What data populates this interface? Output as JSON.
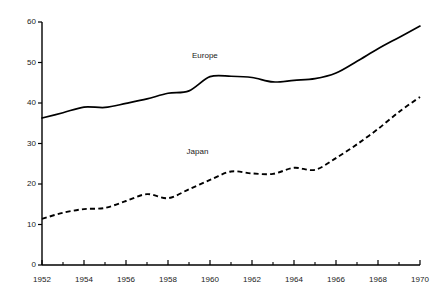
{
  "chart_data": {
    "type": "line",
    "title": "",
    "subtitle": "",
    "xlabel": "",
    "ylabel": "",
    "xlim": [
      1952,
      1970
    ],
    "ylim": [
      0,
      60
    ],
    "grid": false,
    "legend_position": "inline-annotation",
    "x": [
      1952,
      1953,
      1954,
      1955,
      1956,
      1957,
      1958,
      1959,
      1960,
      1961,
      1962,
      1963,
      1964,
      1965,
      1966,
      1967,
      1968,
      1969,
      1970
    ],
    "y_ticks": [
      0,
      10,
      20,
      30,
      40,
      50,
      60
    ],
    "y_tick_labels": [
      "0",
      "10",
      "20",
      "30",
      "40",
      "50",
      "60"
    ],
    "x_ticks_major": [
      1952,
      1954,
      1956,
      1958,
      1960,
      1962,
      1964,
      1966,
      1968,
      1970
    ],
    "x_tick_labels": [
      "1952",
      "1954",
      "1956",
      "1958",
      "1960",
      "1962",
      "1964",
      "1966",
      "1968",
      "1970"
    ],
    "x_ticks_minor": [
      1953,
      1955,
      1957,
      1959,
      1961,
      1963,
      1965,
      1967,
      1969
    ],
    "series": [
      {
        "name": "Europe",
        "style": "solid",
        "color": "#000000",
        "label_x": 1960,
        "label_y": 51.5,
        "values": [
          36.3,
          37.6,
          39.0,
          38.9,
          39.9,
          41.0,
          42.4,
          43.0,
          46.5,
          46.6,
          46.3,
          45.2,
          45.6,
          46.0,
          47.4,
          50.3,
          53.4,
          56.2,
          59.0
        ]
      },
      {
        "name": "Japan",
        "style": "dashed",
        "color": "#000000",
        "label_x": 1959.6,
        "label_y": 28.0,
        "values": [
          11.4,
          12.9,
          13.8,
          14.1,
          15.8,
          17.5,
          16.5,
          18.7,
          21.0,
          23.1,
          22.6,
          22.5,
          24.0,
          23.5,
          26.4,
          29.8,
          33.6,
          37.8,
          41.5
        ]
      }
    ]
  },
  "axes": {
    "y_axis_name": "value-axis",
    "x_axis_name": "year-axis"
  }
}
